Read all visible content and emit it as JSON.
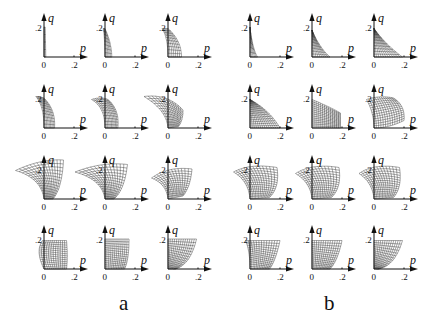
{
  "figure": {
    "group_labels": {
      "a": "a",
      "b": "b"
    }
  },
  "chart_data": {
    "type": "line",
    "subtype": "mesh-grid small multiples",
    "title": "",
    "xlabel": "p",
    "ylabel": "q",
    "xticks": [
      "0",
      ".2"
    ],
    "yticks": [
      ".2"
    ],
    "xlim": [
      0,
      0.29
    ],
    "ylim": [
      0,
      0.28
    ],
    "grid": false,
    "layout": {
      "groups": [
        "a",
        "b"
      ],
      "rows": 4,
      "cols_per_group": 3
    },
    "panels": [
      {
        "group": "a",
        "row": 1,
        "col": 1,
        "mesh": {
          "corners": [
            [
              0,
              0
            ],
            [
              0.012,
              0
            ],
            [
              0.008,
              0.2
            ],
            [
              0,
              0.2
            ]
          ],
          "ctrl": {},
          "nu": 2,
          "nv": 4
        }
      },
      {
        "group": "a",
        "row": 1,
        "col": 2,
        "mesh": {
          "corners": [
            [
              0,
              0
            ],
            [
              0.045,
              0
            ],
            [
              0,
              0.19
            ],
            [
              -0.012,
              0.19
            ]
          ],
          "ctrl": {
            "right": [
              0.045,
              0.09
            ],
            "left": [
              0,
              0.12
            ]
          },
          "nu": 5,
          "nv": 8
        }
      },
      {
        "group": "a",
        "row": 1,
        "col": 3,
        "mesh": {
          "corners": [
            [
              0,
              0
            ],
            [
              0.09,
              0
            ],
            [
              0,
              0.19
            ],
            [
              -0.04,
              0.19
            ]
          ],
          "ctrl": {
            "right": [
              0.09,
              0.11
            ],
            "left": [
              0,
              0.13
            ]
          },
          "nu": 7,
          "nv": 10
        }
      },
      {
        "group": "a",
        "row": 2,
        "col": 1,
        "mesh": {
          "corners": [
            [
              0,
              0
            ],
            [
              0.07,
              0
            ],
            [
              0,
              0.2
            ],
            [
              -0.055,
              0.21
            ]
          ],
          "ctrl": {
            "right": [
              0.08,
              0.12
            ],
            "left": [
              0,
              0.15
            ],
            "top": [
              -0.03,
              0.21
            ]
          },
          "nu": 8,
          "nv": 11
        }
      },
      {
        "group": "a",
        "row": 2,
        "col": 2,
        "mesh": {
          "corners": [
            [
              0,
              0
            ],
            [
              0.085,
              0
            ],
            [
              0.02,
              0.19
            ],
            [
              -0.09,
              0.19
            ]
          ],
          "ctrl": {
            "right": [
              0.1,
              0.12
            ],
            "left": [
              0,
              0.14
            ],
            "top": [
              -0.03,
              0.21
            ]
          },
          "nu": 10,
          "nv": 12
        }
      },
      {
        "group": "a",
        "row": 2,
        "col": 3,
        "mesh": {
          "corners": [
            [
              0,
              0
            ],
            [
              0.07,
              0.01
            ],
            [
              0.1,
              0.12
            ],
            [
              -0.16,
              0.21
            ]
          ],
          "ctrl": {
            "top": [
              0,
              0.23
            ],
            "left": [
              -0.01,
              0.12
            ],
            "right": [
              0.1,
              0.05
            ]
          },
          "nu": 12,
          "nv": 12
        }
      },
      {
        "group": "a",
        "row": 3,
        "col": 1,
        "mesh": {
          "corners": [
            [
              0,
              0
            ],
            [
              0.06,
              0
            ],
            [
              0.13,
              0.26
            ],
            [
              -0.19,
              0.19
            ]
          ],
          "ctrl": {
            "top": [
              -0.02,
              0.27
            ],
            "left": [
              -0.02,
              0.14
            ],
            "right": [
              0.12,
              0.07
            ]
          },
          "nu": 14,
          "nv": 14
        }
      },
      {
        "group": "a",
        "row": 3,
        "col": 2,
        "mesh": {
          "corners": [
            [
              0,
              0
            ],
            [
              0.06,
              0
            ],
            [
              0.15,
              0.23
            ],
            [
              -0.2,
              0.18
            ]
          ],
          "ctrl": {
            "top": [
              -0.02,
              0.25
            ],
            "left": [
              -0.02,
              0.13
            ],
            "right": [
              0.13,
              0.06
            ]
          },
          "nu": 14,
          "nv": 14
        }
      },
      {
        "group": "a",
        "row": 3,
        "col": 3,
        "mesh": {
          "corners": [
            [
              0,
              0
            ],
            [
              0.1,
              0.02
            ],
            [
              0.16,
              0.2
            ],
            [
              -0.11,
              0.14
            ]
          ],
          "ctrl": {
            "top": [
              0,
              0.22
            ],
            "left": [
              -0.01,
              0.1
            ],
            "right": [
              0.15,
              0.08
            ]
          },
          "nu": 13,
          "nv": 13
        }
      },
      {
        "group": "a",
        "row": 4,
        "col": 1,
        "mesh": {
          "corners": [
            [
              0,
              0
            ],
            [
              0.15,
              0
            ],
            [
              0.15,
              0.19
            ],
            [
              -0.01,
              0.19
            ]
          ],
          "ctrl": {
            "left": [
              -0.06,
              0.12
            ],
            "right": [
              0.16,
              0.08
            ]
          },
          "nu": 12,
          "nv": 14
        }
      },
      {
        "group": "a",
        "row": 4,
        "col": 2,
        "mesh": {
          "corners": [
            [
              0,
              0
            ],
            [
              0.13,
              0
            ],
            [
              0.16,
              0.2
            ],
            [
              0,
              0.2
            ]
          ],
          "ctrl": {
            "right": [
              0.16,
              0.06
            ]
          },
          "nu": 12,
          "nv": 14
        }
      },
      {
        "group": "a",
        "row": 4,
        "col": 3,
        "mesh": {
          "corners": [
            [
              0,
              0
            ],
            [
              0.05,
              0
            ],
            [
              0.19,
              0.2
            ],
            [
              0,
              0.2
            ]
          ],
          "ctrl": {
            "right": [
              0.15,
              0.03
            ]
          },
          "nu": 13,
          "nv": 14
        }
      },
      {
        "group": "b",
        "row": 1,
        "col": 1,
        "mesh": {
          "corners": [
            [
              0,
              0
            ],
            [
              0.05,
              0
            ],
            [
              0,
              0.2
            ],
            [
              0,
              0.2
            ]
          ],
          "ctrl": {
            "right": [
              0.015,
              0.06
            ]
          },
          "nu": 5,
          "nv": 6
        }
      },
      {
        "group": "b",
        "row": 1,
        "col": 2,
        "mesh": {
          "corners": [
            [
              0,
              0
            ],
            [
              0.12,
              0
            ],
            [
              0,
              0.18
            ],
            [
              0,
              0.18
            ]
          ],
          "ctrl": {
            "right": [
              0.05,
              0.06
            ]
          },
          "nu": 9,
          "nv": 9
        }
      },
      {
        "group": "b",
        "row": 1,
        "col": 3,
        "mesh": {
          "corners": [
            [
              0,
              0
            ],
            [
              0.19,
              0
            ],
            [
              0,
              0.19
            ],
            [
              0,
              0.19
            ]
          ],
          "ctrl": {
            "right": [
              0.08,
              0.08
            ]
          },
          "nu": 12,
          "nv": 10
        }
      },
      {
        "group": "b",
        "row": 2,
        "col": 1,
        "mesh": {
          "corners": [
            [
              0,
              0
            ],
            [
              0.2,
              0
            ],
            [
              0,
              0.19
            ],
            [
              0,
              0.19
            ]
          ],
          "ctrl": {
            "right": [
              0.13,
              0.12
            ]
          },
          "nu": 14,
          "nv": 14
        }
      },
      {
        "group": "b",
        "row": 2,
        "col": 2,
        "mesh": {
          "corners": [
            [
              0,
              0
            ],
            [
              0.19,
              0
            ],
            [
              0.19,
              0.1
            ],
            [
              0,
              0.19
            ]
          ],
          "ctrl": {
            "top": [
              0.1,
              0.15
            ]
          },
          "nu": 14,
          "nv": 14
        }
      },
      {
        "group": "b",
        "row": 2,
        "col": 3,
        "mesh": {
          "corners": [
            [
              0,
              0
            ],
            [
              0.2,
              0.05
            ],
            [
              0.13,
              0.2
            ],
            [
              -0.05,
              0.19
            ]
          ],
          "ctrl": {
            "bottom": [
              0.1,
              0
            ],
            "right": [
              0.21,
              0.15
            ],
            "top": [
              0.04,
              0.22
            ],
            "left": [
              0,
              0.1
            ]
          },
          "nu": 13,
          "nv": 13
        }
      },
      {
        "group": "b",
        "row": 3,
        "col": 1,
        "mesh": {
          "corners": [
            [
              0,
              0
            ],
            [
              0.13,
              0.01
            ],
            [
              0.18,
              0.21
            ],
            [
              -0.11,
              0.18
            ]
          ],
          "ctrl": {
            "top": [
              0,
              0.24
            ],
            "left": [
              -0.01,
              0.12
            ],
            "right": [
              0.2,
              0.08
            ]
          },
          "nu": 14,
          "nv": 14
        }
      },
      {
        "group": "b",
        "row": 3,
        "col": 2,
        "mesh": {
          "corners": [
            [
              0,
              0
            ],
            [
              0.13,
              0.01
            ],
            [
              0.18,
              0.21
            ],
            [
              -0.11,
              0.17
            ]
          ],
          "ctrl": {
            "top": [
              0,
              0.24
            ],
            "left": [
              -0.01,
              0.11
            ],
            "right": [
              0.2,
              0.08
            ]
          },
          "nu": 14,
          "nv": 14
        }
      },
      {
        "group": "b",
        "row": 3,
        "col": 3,
        "mesh": {
          "corners": [
            [
              0,
              0
            ],
            [
              0.13,
              0.01
            ],
            [
              0.17,
              0.21
            ],
            [
              -0.1,
              0.17
            ]
          ],
          "ctrl": {
            "top": [
              0,
              0.24
            ],
            "left": [
              -0.01,
              0.11
            ],
            "right": [
              0.19,
              0.08
            ]
          },
          "nu": 14,
          "nv": 14
        }
      },
      {
        "group": "b",
        "row": 4,
        "col": 1,
        "mesh": {
          "corners": [
            [
              0,
              0
            ],
            [
              0.13,
              0
            ],
            [
              0.2,
              0.19
            ],
            [
              -0.03,
              0.19
            ]
          ],
          "ctrl": {
            "right": [
              0.17,
              0.05
            ],
            "left": [
              0,
              0.12
            ]
          },
          "nu": 13,
          "nv": 14
        }
      },
      {
        "group": "b",
        "row": 4,
        "col": 2,
        "mesh": {
          "corners": [
            [
              0,
              0
            ],
            [
              0.12,
              0
            ],
            [
              0.2,
              0.19
            ],
            [
              0,
              0.19
            ]
          ],
          "ctrl": {
            "right": [
              0.17,
              0.05
            ]
          },
          "nu": 13,
          "nv": 14
        }
      },
      {
        "group": "b",
        "row": 4,
        "col": 3,
        "mesh": {
          "corners": [
            [
              0,
              0
            ],
            [
              0.03,
              0
            ],
            [
              0.19,
              0.19
            ],
            [
              0,
              0.19
            ]
          ],
          "ctrl": {
            "right": [
              0.14,
              0.02
            ]
          },
          "nu": 13,
          "nv": 14
        }
      }
    ]
  }
}
